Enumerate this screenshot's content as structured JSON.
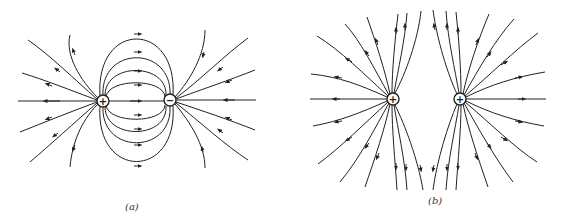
{
  "figure": {
    "panels": [
      {
        "id": "a",
        "label": "(a)",
        "description": "Electric field lines of an electric dipole (opposite charges)",
        "charges": [
          {
            "sign": "+",
            "symbol": "+"
          },
          {
            "sign": "-",
            "symbol": "−"
          }
        ]
      },
      {
        "id": "b",
        "label": "(b)",
        "description": "Electric field lines of two equal positive charges",
        "charges": [
          {
            "sign": "+",
            "symbol": "+"
          },
          {
            "sign": "+",
            "symbol": "+"
          }
        ]
      }
    ],
    "colors": {
      "line": "#222222",
      "background": "#ffffff"
    }
  }
}
